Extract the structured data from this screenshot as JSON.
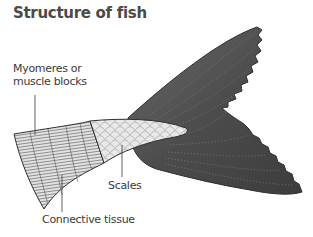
{
  "title": "Structure of fish",
  "labels": {
    "myomeres_line1": "Myomeres or",
    "myomeres_line2": "muscle blocks",
    "scales": "Scales",
    "connective_tissue": "Connective tissue"
  },
  "colors": {
    "fin": "#4f4f4f",
    "fin_dark": "#3a3a3a",
    "scales_fill": "#e6e6e6",
    "muscle_fill": "#d8d8d8",
    "text": "#3a3a3a"
  }
}
